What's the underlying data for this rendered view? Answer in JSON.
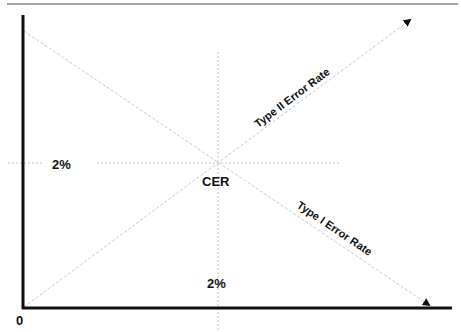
{
  "diagram": {
    "origin_label": "0",
    "crossover_label": "CER",
    "y_value_label": "2%",
    "x_value_label": "2%",
    "rising_line_label": "Type II Error Rate",
    "falling_line_label": "Type I Error Rate",
    "colors": {
      "axis": "#111111",
      "guide": "#bdbdbd",
      "text": "#111111",
      "background": "#ffffff"
    }
  }
}
